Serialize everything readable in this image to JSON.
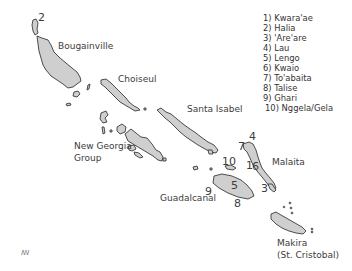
{
  "map": {
    "region": "Solomon Islands",
    "island_fill": "#cfcfcf",
    "island_stroke": "#3a3a3a",
    "labels": {
      "bougainville": "Bougainville",
      "choiseul": "Choiseul",
      "santa_isabel": "Santa Isabel",
      "new_georgia_1": "New Georgia",
      "new_georgia_2": "Group",
      "malaita": "Malaita",
      "guadalcanal": "Guadalcanal",
      "makira_1": "Makira",
      "makira_2": "(St. Cristobal)"
    },
    "markers": {
      "m1": "1",
      "m2": "2",
      "m3": "3",
      "m4": "4",
      "m5": "5",
      "m6": "6",
      "m7": "7",
      "m8": "8",
      "m9": "9",
      "m10": "10"
    },
    "corner_mark": "ꟿ"
  },
  "legend": {
    "items": [
      "1) Kwara'ae",
      "2) Halia",
      "3) 'Are'are",
      "4) Lau",
      "5) Lengo",
      "6) Kwaio",
      "7) To'abaita",
      "8) Talise",
      "9) Ghari",
      "10) Nggela/Gela"
    ]
  }
}
